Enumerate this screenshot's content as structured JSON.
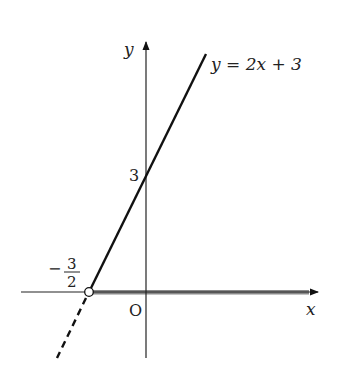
{
  "diagram": {
    "type": "coordinate-graph",
    "axes": {
      "x_label": "x",
      "y_label": "y",
      "origin_label": "O"
    },
    "line": {
      "equation_label": "y = 2x + 3",
      "slope": 2,
      "intercept": 3,
      "y_intercept_label": "3",
      "x_intercept_label_sign": "−",
      "x_intercept_numerator": "3",
      "x_intercept_denominator": "2",
      "x_intercept_value": -1.5,
      "solid_for": "x > -3/2",
      "dashed_for": "x < -3/2"
    },
    "highlight": {
      "description": "shaded ray on x-axis from x = -3/2 to the right",
      "endpoint": "open circle at (-3/2, 0)"
    },
    "colors": {
      "line": "#111111",
      "axis": "#222222",
      "shaded_ray": "#8a8a8a"
    }
  }
}
